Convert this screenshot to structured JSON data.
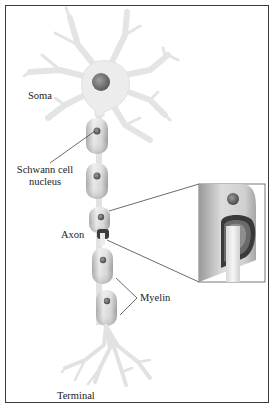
{
  "labels": {
    "soma": "Soma",
    "schwann_line1": "Schwann cell",
    "schwann_line2": "nucleus",
    "axon": "Axon",
    "myelin": "Myelin",
    "terminal": "Terminal"
  },
  "colors": {
    "cell_body": "#eeeeee",
    "cell_outline": "#d2d2d2",
    "nucleus": "#7a7a7a",
    "myelin_light": "#e6e6e6",
    "myelin_dark": "#9a9a9a",
    "leader_line": "#444444",
    "frame": "#3a3a3a"
  },
  "structure": {
    "dendrite_count": 7,
    "myelin_segments": 5,
    "inset": "cross-section of myelin sheath wrapped around axon"
  }
}
